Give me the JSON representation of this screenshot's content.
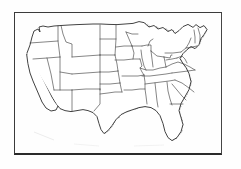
{
  "figure": {
    "caption": "",
    "has_frame": true,
    "frame_style": "rectangular box border"
  },
  "colors": {
    "background": "#fefefe",
    "outline": "#2e2e2e",
    "state_border": "#3a3a3a",
    "stipple": "#2b2b2b",
    "frame": "#2a2a2a"
  },
  "map": {
    "region": "Contiguous United States",
    "projection_note": "simplified hand-drawn outline",
    "shading_type": "stipple",
    "shaded_label": "Shaded (stippled) range",
    "unshaded_label": "Unshaded (absent)",
    "shaded_regions": [
      "California",
      "Texas",
      "Oklahoma",
      "Kansas",
      "Eastern Nebraska",
      "Eastern South Dakota",
      "Eastern North Dakota",
      "Minnesota",
      "Iowa",
      "Missouri",
      "Arkansas",
      "Louisiana",
      "Mississippi",
      "Alabama",
      "Georgia",
      "Florida",
      "South Carolina",
      "North Carolina",
      "Tennessee",
      "Kentucky",
      "Virginia",
      "West Virginia",
      "Maryland",
      "Delaware",
      "Illinois",
      "Indiana",
      "Ohio",
      "Michigan",
      "Wisconsin",
      "Pennsylvania",
      "New York",
      "New Jersey",
      "Connecticut",
      "Rhode Island",
      "Massachusetts",
      "Vermont",
      "New Hampshire",
      "Maine"
    ],
    "unshaded_regions": [
      "Washington",
      "Oregon",
      "Idaho",
      "Montana",
      "Wyoming",
      "Nevada",
      "Utah",
      "Colorado",
      "Arizona",
      "New Mexico",
      "Western North Dakota",
      "Western South Dakota",
      "Western Nebraska"
    ],
    "lakes": [
      "Lake Superior",
      "Lake Michigan",
      "Lake Huron",
      "Lake Erie",
      "Lake Ontario"
    ]
  }
}
